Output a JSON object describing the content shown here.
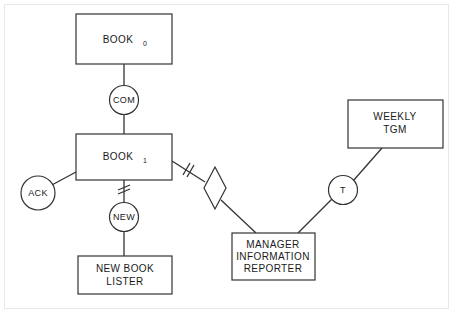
{
  "diagram": {
    "background_color": "#ffffff",
    "stroke_color": "#333333",
    "frame_color": "#e8e8e8",
    "nodes": {
      "book0": {
        "label": "BOOK",
        "subscript": "0",
        "type": "rectangle"
      },
      "book1": {
        "label": "BOOK",
        "subscript": "1",
        "type": "rectangle"
      },
      "new_book_lister": {
        "line1": "NEW BOOK",
        "line2": "LISTER",
        "type": "rectangle"
      },
      "manager_information_reporter": {
        "line1": "MANAGER",
        "line2": "INFORMATION",
        "line3": "REPORTER",
        "type": "rectangle"
      },
      "weekly_tgm": {
        "line1": "WEEKLY",
        "line2": "TGM",
        "type": "rectangle"
      },
      "com": {
        "label": "COM",
        "type": "circle"
      },
      "ack": {
        "label": "ACK",
        "type": "circle"
      },
      "new": {
        "label": "NEW",
        "type": "circle"
      },
      "t": {
        "label": "T",
        "type": "circle"
      },
      "relationship_diamond": {
        "label": "",
        "type": "diamond"
      }
    },
    "edges": [
      {
        "name": "book0-to-com",
        "from": "book0",
        "to": "com",
        "marker": "none"
      },
      {
        "name": "com-to-book1",
        "from": "com",
        "to": "book1",
        "marker": "none"
      },
      {
        "name": "book1-to-ack",
        "from": "book1",
        "to": "ack",
        "marker": "none"
      },
      {
        "name": "book1-to-new",
        "from": "book1",
        "to": "new",
        "marker": "double-slash"
      },
      {
        "name": "new-to-new-book-lister",
        "from": "new",
        "to": "new_book_lister",
        "marker": "none"
      },
      {
        "name": "book1-to-diamond",
        "from": "book1",
        "to": "relationship_diamond",
        "marker": "double-slash"
      },
      {
        "name": "diamond-to-manager-information-reporter",
        "from": "relationship_diamond",
        "to": "manager_information_reporter",
        "marker": "none"
      },
      {
        "name": "manager-information-reporter-to-t",
        "from": "manager_information_reporter",
        "to": "t",
        "marker": "none"
      },
      {
        "name": "t-to-weekly-tgm",
        "from": "t",
        "to": "weekly_tgm",
        "marker": "none"
      }
    ]
  }
}
